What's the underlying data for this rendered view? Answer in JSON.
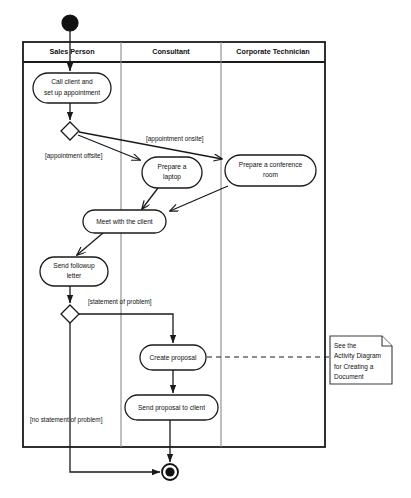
{
  "diagram": {
    "type": "uml-activity-diagram",
    "canvas": {
      "width": 411,
      "height": 498
    },
    "colors": {
      "stroke": "#1a1a1a",
      "lane_divider": "#8a8a8a",
      "fill": "#ffffff",
      "text": "#111111",
      "note_stroke": "#3a3a3a"
    },
    "swimlanes": [
      {
        "id": "lane-sales-person",
        "label": "Sales Person",
        "x": 23,
        "width": 98
      },
      {
        "id": "lane-consultant",
        "label": "Consultant",
        "x": 121,
        "width": 100
      },
      {
        "id": "lane-corporate-technician",
        "label": "Corporate Technician",
        "x": 221,
        "width": 104
      }
    ],
    "lane_frame": {
      "x": 23,
      "y": 42,
      "width": 302,
      "height": 405,
      "header_height": 20
    },
    "nodes": {
      "initial": {
        "id": "node-initial",
        "cx": 70,
        "cy": 23,
        "r": 8,
        "label": "initial-node"
      },
      "final": {
        "id": "node-final",
        "cx": 170,
        "cy": 472,
        "r_outer": 8,
        "r_inner": 4.6,
        "label": "final-node"
      },
      "activities": [
        {
          "id": "activity-call-client",
          "label": "Call client and\nset up appointment",
          "lines": [
            "Call client and",
            "set up appointment"
          ],
          "x": 33,
          "y": 73,
          "width": 78,
          "height": 30,
          "lane": "Sales Person"
        },
        {
          "id": "activity-prepare-laptop",
          "label": "Prepare a\nlaptop",
          "lines": [
            "Prepare a",
            "laptop"
          ],
          "x": 142,
          "y": 157,
          "width": 60,
          "height": 31,
          "lane": "Consultant"
        },
        {
          "id": "activity-prepare-conference-room",
          "label": "Prepare a conference\nroom",
          "lines": [
            "Prepare a conference",
            "room"
          ],
          "x": 225,
          "y": 155,
          "width": 91,
          "height": 31,
          "lane": "Corporate Technician"
        },
        {
          "id": "activity-meet-with-client",
          "label": "Meet with the client",
          "lines": [
            "Meet with the client"
          ],
          "x": 83,
          "y": 210,
          "width": 83,
          "height": 23,
          "lane": "Sales Person"
        },
        {
          "id": "activity-send-followup-letter",
          "label": "Send followup\nletter",
          "lines": [
            "Send followup",
            "letter"
          ],
          "x": 40,
          "y": 257,
          "width": 68,
          "height": 29,
          "lane": "Sales Person"
        },
        {
          "id": "activity-create-proposal",
          "label": "Create proposal",
          "lines": [
            "Create proposal"
          ],
          "x": 140,
          "y": 345,
          "width": 66,
          "height": 25,
          "lane": "Consultant"
        },
        {
          "id": "activity-send-proposal-to-client",
          "label": "Send proposal to client",
          "lines": [
            "Send proposal to client"
          ],
          "x": 125,
          "y": 395,
          "width": 93,
          "height": 25,
          "lane": "Consultant"
        }
      ],
      "decisions": [
        {
          "id": "decision-appointment-location",
          "cx": 70,
          "cy": 131,
          "rx": 9,
          "ry": 9
        },
        {
          "id": "decision-problem-statement",
          "cx": 70,
          "cy": 314,
          "rx": 9,
          "ry": 9
        }
      ],
      "note": {
        "id": "note-see-activity-diagram",
        "lines": [
          "See the",
          "Activity Diagram",
          "for Creating a",
          "Document"
        ],
        "text": "See the Activity Diagram for Creating a Document",
        "x": 330,
        "y": 336,
        "width": 62,
        "height": 48,
        "fold": 10
      }
    },
    "guards": [
      {
        "id": "guard-appointment-offsite",
        "text": "[appointment offsite]",
        "x": 45,
        "y": 156
      },
      {
        "id": "guard-appointment-onsite",
        "text": "[appointment onsite]",
        "x": 146,
        "y": 139
      },
      {
        "id": "guard-statement-of-problem",
        "text": "[statement of problem]",
        "x": 88,
        "y": 302
      },
      {
        "id": "guard-no-statement-of-problem",
        "text": "[no statement of problem]",
        "x": 30,
        "y": 420
      }
    ],
    "edges": [
      {
        "id": "edge-initial-to-call-client",
        "from": "initial",
        "to": "activity-call-client"
      },
      {
        "id": "edge-call-client-to-decision",
        "from": "activity-call-client",
        "to": "decision-appointment-location"
      },
      {
        "id": "edge-decision-to-prepare-laptop",
        "from": "decision-appointment-location",
        "to": "activity-prepare-laptop",
        "guard": "[appointment offsite]"
      },
      {
        "id": "edge-decision-to-prepare-conference-room",
        "from": "decision-appointment-location",
        "to": "activity-prepare-conference-room",
        "guard": "[appointment onsite]"
      },
      {
        "id": "edge-prepare-laptop-to-meet",
        "from": "activity-prepare-laptop",
        "to": "activity-meet-with-client"
      },
      {
        "id": "edge-prepare-conference-room-to-meet",
        "from": "activity-prepare-conference-room",
        "to": "activity-meet-with-client"
      },
      {
        "id": "edge-meet-to-send-followup",
        "from": "activity-meet-with-client",
        "to": "activity-send-followup-letter"
      },
      {
        "id": "edge-send-followup-to-decision",
        "from": "activity-send-followup-letter",
        "to": "decision-problem-statement"
      },
      {
        "id": "edge-decision-to-create-proposal",
        "from": "decision-problem-statement",
        "to": "activity-create-proposal",
        "guard": "[statement of problem]"
      },
      {
        "id": "edge-decision-to-final",
        "from": "decision-problem-statement",
        "to": "final",
        "guard": "[no statement of problem]"
      },
      {
        "id": "edge-create-proposal-to-send-proposal",
        "from": "activity-create-proposal",
        "to": "activity-send-proposal-to-client"
      },
      {
        "id": "edge-send-proposal-to-final",
        "from": "activity-send-proposal-to-client",
        "to": "final"
      },
      {
        "id": "edge-create-proposal-to-note",
        "from": "activity-create-proposal",
        "to": "note-see-activity-diagram",
        "style": "dashed"
      }
    ]
  }
}
